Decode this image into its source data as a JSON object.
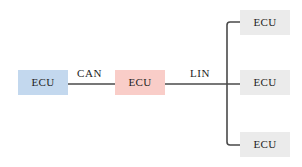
{
  "diagram": {
    "background_color": "#ffffff",
    "line_color": "#4a4a4a",
    "text_color": "#1d1d1d",
    "nodes": [
      {
        "id": "ecu-gateway-blue",
        "label": "ECU",
        "fill": "#c3d8ee",
        "role": "CAN node"
      },
      {
        "id": "ecu-central-pink",
        "label": "ECU",
        "fill": "#f9cdc8",
        "role": "Gateway between CAN and LIN"
      },
      {
        "id": "ecu-lin-top",
        "label": "ECU",
        "fill": "#ebebeb",
        "role": "LIN node"
      },
      {
        "id": "ecu-lin-middle",
        "label": "ECU",
        "fill": "#ebebeb",
        "role": "LIN node"
      },
      {
        "id": "ecu-lin-bottom",
        "label": "ECU",
        "fill": "#ebebeb",
        "role": "LIN node"
      }
    ],
    "bus_labels": [
      {
        "id": "can",
        "label": "CAN"
      },
      {
        "id": "lin",
        "label": "LIN"
      }
    ]
  }
}
